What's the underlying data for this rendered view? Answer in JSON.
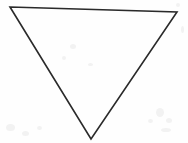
{
  "canvas": {
    "width": 188,
    "height": 143,
    "background_color": "#fefefe",
    "paper_tone": "white scanned paper"
  },
  "figure": {
    "name": "downward-pointing-triangle",
    "shape_type": "triangle",
    "orientation": "point-down",
    "fill": "none",
    "fill_color": "#ffffff",
    "stroke_color": "#2a2a2a",
    "stroke_width": 1.6,
    "stroke_style": "hand-drawn ink outline",
    "closed": true,
    "vertices": [
      {
        "label": "top-left",
        "x": 10,
        "y": 7
      },
      {
        "label": "top-right",
        "x": 177,
        "y": 12
      },
      {
        "label": "bottom-apex",
        "x": 91,
        "y": 139
      }
    ],
    "points_attr": "10,7 177,12 91,139",
    "edges": [
      {
        "name": "top-edge",
        "from": "top-left",
        "to": "top-right"
      },
      {
        "name": "right-edge",
        "from": "top-right",
        "to": "bottom-apex"
      },
      {
        "name": "left-edge",
        "from": "bottom-apex",
        "to": "top-left"
      }
    ]
  },
  "artifacts": {
    "description": "faint gray scanner speckles near corners",
    "color": "#f2f2f2",
    "specks": [
      {
        "x": 6,
        "y": 124,
        "w": 9,
        "h": 7
      },
      {
        "x": 22,
        "y": 131,
        "w": 7,
        "h": 5
      },
      {
        "x": 37,
        "y": 126,
        "w": 5,
        "h": 4
      },
      {
        "x": 156,
        "y": 108,
        "w": 8,
        "h": 9
      },
      {
        "x": 166,
        "y": 118,
        "w": 6,
        "h": 5
      },
      {
        "x": 161,
        "y": 128,
        "w": 10,
        "h": 4
      },
      {
        "x": 148,
        "y": 119,
        "w": 5,
        "h": 4
      },
      {
        "x": 70,
        "y": 44,
        "w": 6,
        "h": 5
      },
      {
        "x": 62,
        "y": 56,
        "w": 4,
        "h": 4
      },
      {
        "x": 88,
        "y": 63,
        "w": 5,
        "h": 3
      },
      {
        "x": 176,
        "y": 3,
        "w": 4,
        "h": 4
      },
      {
        "x": 181,
        "y": 26,
        "w": 3,
        "h": 7
      }
    ]
  },
  "text": {
    "labels": [],
    "note": "no text is present in this image"
  }
}
